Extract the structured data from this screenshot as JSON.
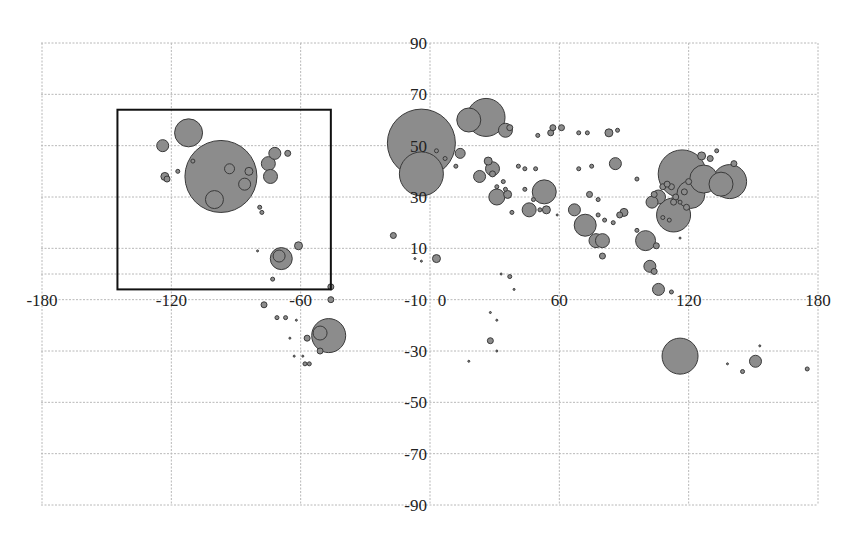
{
  "chart_data": {
    "type": "scatter",
    "subtype": "bubble",
    "title": "",
    "xlabel": "",
    "ylabel": "",
    "xlim": [
      -180,
      180
    ],
    "ylim": [
      -90,
      90
    ],
    "x_ticks": [
      -180,
      -120,
      -60,
      0,
      60,
      120,
      180
    ],
    "y_ticks": [
      90,
      70,
      50,
      30,
      10,
      -10,
      -30,
      -50,
      -70,
      -90
    ],
    "x_tick_labels": [
      "-180",
      "-120",
      "-60",
      "0",
      "60",
      "120",
      "180"
    ],
    "y_tick_labels": [
      "90",
      "70",
      "50",
      "30",
      "10",
      "-10",
      "-30",
      "-50",
      "-70",
      "-90"
    ],
    "grid": true,
    "legend": null,
    "annotation": {
      "type": "rectangle",
      "x_range": [
        -145,
        -46
      ],
      "y_range": [
        -6,
        64
      ]
    },
    "colors": {
      "bubble_fill": "#8c8c8c",
      "bubble_stroke": "#3a3a3a",
      "grid": "#b8b8b8",
      "frame": "#111111"
    },
    "points": [
      {
        "lon": -97,
        "lat": 38,
        "r": 36
      },
      {
        "lon": -112,
        "lat": 55,
        "r": 14
      },
      {
        "lon": -124,
        "lat": 50,
        "r": 6
      },
      {
        "lon": -123,
        "lat": 38,
        "r": 4
      },
      {
        "lon": -122,
        "lat": 37,
        "r": 3
      },
      {
        "lon": -100,
        "lat": 29,
        "r": 9
      },
      {
        "lon": -93,
        "lat": 41,
        "r": 5
      },
      {
        "lon": -86,
        "lat": 35,
        "r": 6
      },
      {
        "lon": -84,
        "lat": 40,
        "r": 4
      },
      {
        "lon": -75,
        "lat": 43,
        "r": 7
      },
      {
        "lon": -74,
        "lat": 38,
        "r": 7
      },
      {
        "lon": -72,
        "lat": 47,
        "r": 6
      },
      {
        "lon": -110,
        "lat": 44,
        "r": 2
      },
      {
        "lon": -117,
        "lat": 40,
        "r": 2
      },
      {
        "lon": -79,
        "lat": 26,
        "r": 2
      },
      {
        "lon": -78,
        "lat": 24,
        "r": 2
      },
      {
        "lon": -69,
        "lat": 6,
        "r": 11
      },
      {
        "lon": -70,
        "lat": 7,
        "r": 6
      },
      {
        "lon": -61,
        "lat": 11,
        "r": 4
      },
      {
        "lon": -73,
        "lat": -2,
        "r": 2
      },
      {
        "lon": -80,
        "lat": 9,
        "r": 1
      },
      {
        "lon": -66,
        "lat": 47,
        "r": 3
      },
      {
        "lon": -46,
        "lat": -5,
        "r": 3
      },
      {
        "lon": -46,
        "lat": -10,
        "r": 3
      },
      {
        "lon": -77,
        "lat": -12,
        "r": 3
      },
      {
        "lon": -71,
        "lat": -17,
        "r": 2
      },
      {
        "lon": -67,
        "lat": -17,
        "r": 2
      },
      {
        "lon": -62,
        "lat": -18,
        "r": 1
      },
      {
        "lon": -57,
        "lat": -25,
        "r": 3
      },
      {
        "lon": -65,
        "lat": -25,
        "r": 1
      },
      {
        "lon": -63,
        "lat": -32,
        "r": 1
      },
      {
        "lon": -59,
        "lat": -32,
        "r": 1
      },
      {
        "lon": -58,
        "lat": -35,
        "r": 2
      },
      {
        "lon": -56,
        "lat": -35,
        "r": 2
      },
      {
        "lon": -51,
        "lat": -30,
        "r": 3
      },
      {
        "lon": -47,
        "lat": -24,
        "r": 17
      },
      {
        "lon": -51,
        "lat": -23,
        "r": 7
      },
      {
        "lon": -4,
        "lat": 51,
        "r": 34
      },
      {
        "lon": -4,
        "lat": 39,
        "r": 22
      },
      {
        "lon": 3,
        "lat": 48,
        "r": 2
      },
      {
        "lon": 14,
        "lat": 47,
        "r": 5
      },
      {
        "lon": 18,
        "lat": 60,
        "r": 12
      },
      {
        "lon": 26,
        "lat": 61,
        "r": 19
      },
      {
        "lon": 35,
        "lat": 56,
        "r": 7
      },
      {
        "lon": 37,
        "lat": 57,
        "r": 3
      },
      {
        "lon": 12,
        "lat": 42,
        "r": 2
      },
      {
        "lon": 7,
        "lat": 45,
        "r": 2
      },
      {
        "lon": 27,
        "lat": 44,
        "r": 4
      },
      {
        "lon": 23,
        "lat": 38,
        "r": 6
      },
      {
        "lon": 29,
        "lat": 41,
        "r": 7
      },
      {
        "lon": 29,
        "lat": 39,
        "r": 3
      },
      {
        "lon": 34,
        "lat": 36,
        "r": 2
      },
      {
        "lon": 35,
        "lat": 33,
        "r": 2
      },
      {
        "lon": 31,
        "lat": 30,
        "r": 8
      },
      {
        "lon": 36,
        "lat": 31,
        "r": 4
      },
      {
        "lon": 31,
        "lat": 34,
        "r": 2
      },
      {
        "lon": 44,
        "lat": 33,
        "r": 2
      },
      {
        "lon": 53,
        "lat": 32,
        "r": 12
      },
      {
        "lon": 54,
        "lat": 25,
        "r": 4
      },
      {
        "lon": 46,
        "lat": 25,
        "r": 7
      },
      {
        "lon": 48,
        "lat": 29,
        "r": 2
      },
      {
        "lon": 38,
        "lat": 24,
        "r": 2
      },
      {
        "lon": 51,
        "lat": 25,
        "r": 2
      },
      {
        "lon": 59,
        "lat": 23,
        "r": 1
      },
      {
        "lon": 49,
        "lat": 41,
        "r": 2
      },
      {
        "lon": 44,
        "lat": 41,
        "r": 2
      },
      {
        "lon": 41,
        "lat": 42,
        "r": 2
      },
      {
        "lon": 50,
        "lat": 54,
        "r": 2
      },
      {
        "lon": 56,
        "lat": 55,
        "r": 3
      },
      {
        "lon": 57,
        "lat": 57,
        "r": 3
      },
      {
        "lon": 61,
        "lat": 57,
        "r": 3
      },
      {
        "lon": 69,
        "lat": 55,
        "r": 2
      },
      {
        "lon": 73,
        "lat": 55,
        "r": 2
      },
      {
        "lon": 83,
        "lat": 55,
        "r": 4
      },
      {
        "lon": 87,
        "lat": 56,
        "r": 2
      },
      {
        "lon": 69,
        "lat": 41,
        "r": 2
      },
      {
        "lon": 75,
        "lat": 42,
        "r": 2
      },
      {
        "lon": 86,
        "lat": 43,
        "r": 6
      },
      {
        "lon": 74,
        "lat": 31,
        "r": 3
      },
      {
        "lon": 78,
        "lat": 29,
        "r": 2
      },
      {
        "lon": 67,
        "lat": 25,
        "r": 6
      },
      {
        "lon": 72,
        "lat": 19,
        "r": 11
      },
      {
        "lon": 77,
        "lat": 13,
        "r": 7
      },
      {
        "lon": 80,
        "lat": 13,
        "r": 7
      },
      {
        "lon": 80,
        "lat": 7,
        "r": 3
      },
      {
        "lon": 78,
        "lat": 23,
        "r": 2
      },
      {
        "lon": 81,
        "lat": 21,
        "r": 2
      },
      {
        "lon": 85,
        "lat": 20,
        "r": 2
      },
      {
        "lon": 88,
        "lat": 23,
        "r": 3
      },
      {
        "lon": 90,
        "lat": 24,
        "r": 4
      },
      {
        "lon": 96,
        "lat": 17,
        "r": 2
      },
      {
        "lon": 103,
        "lat": 28,
        "r": 6
      },
      {
        "lon": 100,
        "lat": 13,
        "r": 10
      },
      {
        "lon": 105,
        "lat": 11,
        "r": 3
      },
      {
        "lon": 102,
        "lat": 3,
        "r": 6
      },
      {
        "lon": 104,
        "lat": 1,
        "r": 3
      },
      {
        "lon": 106,
        "lat": -6,
        "r": 6
      },
      {
        "lon": 112,
        "lat": -7,
        "r": 2
      },
      {
        "lon": 117,
        "lat": 39,
        "r": 24
      },
      {
        "lon": 113,
        "lat": 23,
        "r": 17
      },
      {
        "lon": 121,
        "lat": 31,
        "r": 14
      },
      {
        "lon": 127,
        "lat": 37,
        "r": 14
      },
      {
        "lon": 139,
        "lat": 36,
        "r": 17
      },
      {
        "lon": 135,
        "lat": 35,
        "r": 12
      },
      {
        "lon": 126,
        "lat": 46,
        "r": 4
      },
      {
        "lon": 130,
        "lat": 45,
        "r": 3
      },
      {
        "lon": 141,
        "lat": 43,
        "r": 3
      },
      {
        "lon": 133,
        "lat": 48,
        "r": 2
      },
      {
        "lon": 106,
        "lat": 30,
        "r": 7
      },
      {
        "lon": 104,
        "lat": 31,
        "r": 3
      },
      {
        "lon": 108,
        "lat": 34,
        "r": 3
      },
      {
        "lon": 112,
        "lat": 34,
        "r": 3
      },
      {
        "lon": 114,
        "lat": 30,
        "r": 3
      },
      {
        "lon": 118,
        "lat": 32,
        "r": 3
      },
      {
        "lon": 120,
        "lat": 36,
        "r": 3
      },
      {
        "lon": 113,
        "lat": 28,
        "r": 3
      },
      {
        "lon": 110,
        "lat": 35,
        "r": 3
      },
      {
        "lon": 116,
        "lat": 28,
        "r": 2
      },
      {
        "lon": 119,
        "lat": 26,
        "r": 3
      },
      {
        "lon": 108,
        "lat": 22,
        "r": 2
      },
      {
        "lon": 111,
        "lat": 21,
        "r": 2
      },
      {
        "lon": 96,
        "lat": 37,
        "r": 2
      },
      {
        "lon": 116,
        "lat": 14,
        "r": 1
      },
      {
        "lon": 116,
        "lat": -32,
        "r": 18
      },
      {
        "lon": 151,
        "lat": -34,
        "r": 6
      },
      {
        "lon": 145,
        "lat": -38,
        "r": 2
      },
      {
        "lon": 138,
        "lat": -35,
        "r": 1
      },
      {
        "lon": 153,
        "lat": -28,
        "r": 1
      },
      {
        "lon": 175,
        "lat": -37,
        "r": 2
      },
      {
        "lon": 28,
        "lat": -26,
        "r": 3
      },
      {
        "lon": 31,
        "lat": -30,
        "r": 1
      },
      {
        "lon": 18,
        "lat": -34,
        "r": 1
      },
      {
        "lon": 28,
        "lat": -15,
        "r": 1
      },
      {
        "lon": 31,
        "lat": -18,
        "r": 1
      },
      {
        "lon": 37,
        "lat": -1,
        "r": 2
      },
      {
        "lon": 33,
        "lat": 0,
        "r": 1
      },
      {
        "lon": 39,
        "lat": -6,
        "r": 1
      },
      {
        "lon": 3,
        "lat": 6,
        "r": 4
      },
      {
        "lon": -17,
        "lat": 15,
        "r": 3
      },
      {
        "lon": -7,
        "lat": 6,
        "r": 1
      },
      {
        "lon": -4,
        "lat": 5,
        "r": 1
      }
    ]
  }
}
